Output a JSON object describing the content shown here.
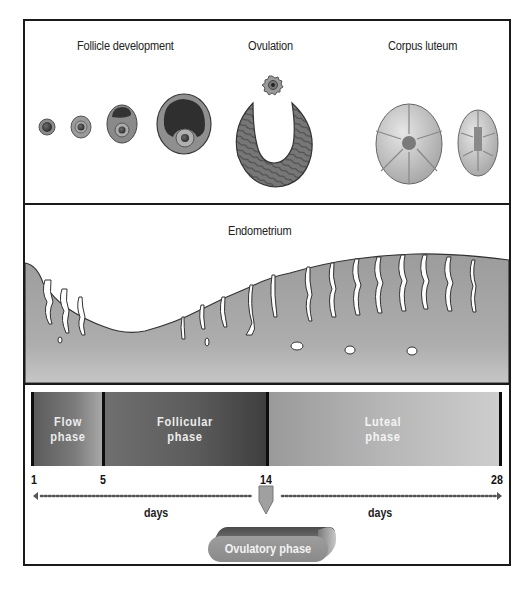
{
  "ovary_panel": {
    "labels": {
      "follicle": "Follicle development",
      "ovulation": "Ovulation",
      "corpus_luteum": "Corpus luteum"
    },
    "illustrations": [
      "primordial-follicle",
      "primary-follicle",
      "secondary-follicle",
      "mature-follicle",
      "released-ovum",
      "ruptured-follicle",
      "corpus-luteum",
      "regressing-corpus-luteum"
    ]
  },
  "endometrium_panel": {
    "label": "Endometrium"
  },
  "phase_panel": {
    "phases": [
      {
        "line1": "Flow",
        "line2": "phase",
        "start_day": 1,
        "end_day": 5
      },
      {
        "line1": "Follicular",
        "line2": "phase",
        "start_day": 5,
        "end_day": 14
      },
      {
        "line1": "Luteal",
        "line2": "phase",
        "start_day": 14,
        "end_day": 28
      }
    ],
    "day_ticks": [
      "1",
      "5",
      "14",
      "28"
    ],
    "days_left": "days",
    "days_right": "days",
    "ovulatory_label": "Ovulatory phase"
  },
  "colors": {
    "frame": "#1a1a1a",
    "tissue": "#a8a8a8",
    "flow_phase": "#6a6a6a",
    "follicular_phase": "#555555",
    "luteal_phase": "#b8b8b8",
    "pill": "#959595"
  }
}
